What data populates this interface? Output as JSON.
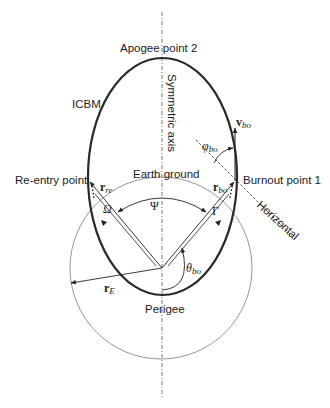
{
  "labels": {
    "apogee": "Apogee point 2",
    "icbm": "ICBM",
    "symmetric_axis": "Symmetric axis",
    "reentry": "Re-entry point",
    "burnout": "Burnout point 1",
    "earth_ground": "Earth ground",
    "horizontal": "Horizontal",
    "perigee": "Perigee"
  },
  "symbols": {
    "v_bo": {
      "main": "v",
      "sub": "bo"
    },
    "phi_bo": {
      "main": "φ",
      "sub": "bo"
    },
    "r_re": {
      "main": "r",
      "sub": "re"
    },
    "r_bo": {
      "main": "r",
      "sub": "bo"
    },
    "r_E": {
      "main": "r",
      "sub": "E"
    },
    "theta_bo": {
      "main": "θ",
      "sub": "bo"
    },
    "omega": "Ω",
    "psi": "Ψ",
    "gamma": "Γ"
  },
  "colors": {
    "trajectory": "#2a2a2a",
    "earth": "#8a8a8a",
    "lines": "#333333",
    "background": "#ffffff"
  }
}
